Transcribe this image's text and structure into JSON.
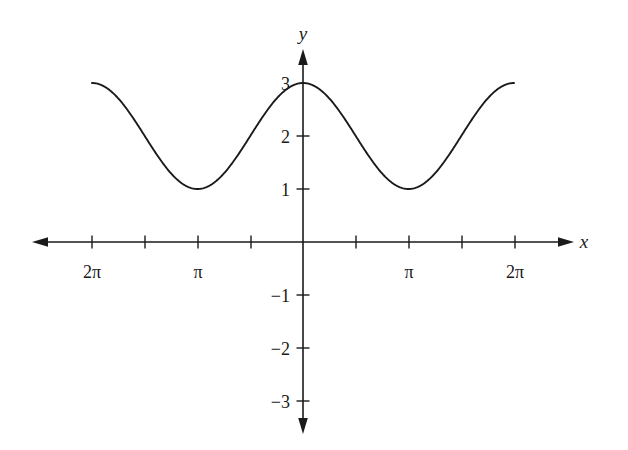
{
  "chart_data": {
    "type": "line",
    "title": "",
    "xlabel": "x",
    "ylabel": "y",
    "function": "y = 2 + cos(x)",
    "xlim": [
      -7.4,
      7.9
    ],
    "ylim": [
      -3.6,
      3.45
    ],
    "grid": false,
    "legend": null,
    "x_axis": {
      "label": "x",
      "arrow_both_ends": true,
      "tick_positions": [
        -6.2832,
        -4.7124,
        -3.1416,
        -1.5708,
        1.5708,
        3.1416,
        4.7124,
        6.2832
      ],
      "tick_labels": [
        "2π",
        "",
        "π",
        "",
        "",
        "π",
        "",
        "2π"
      ],
      "labeled_ticks": [
        {
          "value": -6.2832,
          "label": "2π"
        },
        {
          "value": -3.1416,
          "label": "π"
        },
        {
          "value": 3.1416,
          "label": "π"
        },
        {
          "value": 6.2832,
          "label": "2π"
        }
      ]
    },
    "y_axis": {
      "label": "y",
      "arrow_both_ends": true,
      "tick_positions": [
        -3,
        -2,
        -1,
        1,
        2,
        3
      ],
      "tick_labels": [
        "−3",
        "−2",
        "−1",
        "1",
        "2",
        "3"
      ],
      "labeled_ticks": [
        {
          "value": 3,
          "label": "3"
        },
        {
          "value": 2,
          "label": "2"
        },
        {
          "value": 1,
          "label": "1"
        },
        {
          "value": -1,
          "label": "−1"
        },
        {
          "value": -2,
          "label": "−2"
        },
        {
          "value": -3,
          "label": "−3"
        }
      ]
    },
    "series": [
      {
        "name": "y = 2 + cos(x)",
        "color": "#1a1a1a",
        "x": [
          -6.2832,
          -5.8905,
          -5.4978,
          -5.1051,
          -4.7124,
          -4.3197,
          -3.927,
          -3.5343,
          -3.1416,
          -2.7489,
          -2.3562,
          -1.9635,
          -1.5708,
          -1.1781,
          -0.7854,
          -0.3927,
          0,
          0.3927,
          0.7854,
          1.1781,
          1.5708,
          1.9635,
          2.3562,
          2.7489,
          3.1416,
          3.5343,
          3.927,
          4.3197,
          4.7124,
          5.1051,
          5.4978,
          5.8905,
          6.2832
        ],
        "y": [
          3,
          2.9239,
          2.7071,
          2.3827,
          2,
          1.6173,
          1.2929,
          1.0761,
          1,
          1.0761,
          1.2929,
          1.6173,
          2,
          2.3827,
          2.7071,
          2.9239,
          3,
          2.9239,
          2.7071,
          2.3827,
          2,
          1.6173,
          1.2929,
          1.0761,
          1,
          1.0761,
          1.2929,
          1.6173,
          2,
          2.3827,
          2.7071,
          2.9239,
          3
        ]
      }
    ],
    "key_points": {
      "maxima": [
        {
          "x": "-2π",
          "y": 3
        },
        {
          "x": "0",
          "y": 3
        },
        {
          "x": "2π",
          "y": 3
        }
      ],
      "minima": [
        {
          "x": "-π",
          "y": 1
        },
        {
          "x": "π",
          "y": 1
        }
      ],
      "amplitude": 1,
      "midline": 2,
      "period": "2π"
    }
  },
  "colors": {
    "background": "#ffffff",
    "axis": "#1a1a1a",
    "curve": "#1a1a1a",
    "text": "#1a1a1a"
  }
}
